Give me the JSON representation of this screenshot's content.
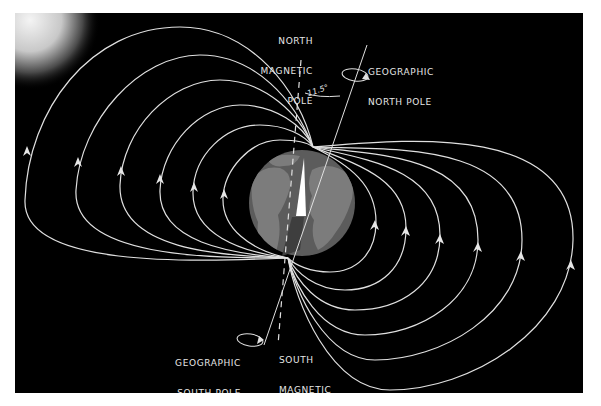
{
  "diagram": {
    "labels": {
      "north_magnetic_pole": [
        "NORTH",
        "MAGNETIC",
        "POLE"
      ],
      "geographic_north_pole": [
        "GEOGRAPHIC",
        "NORTH POLE"
      ],
      "geographic_south_pole": [
        "GEOGRAPHIC",
        "SOUTH POLE"
      ],
      "south_magnetic_pole": [
        "SOUTH",
        "MAGNETIC",
        "POLE"
      ],
      "tilt_angle": "11.5°"
    },
    "colors": {
      "background": "#000000",
      "field_lines": "#e0e0e0",
      "globe_ocean": "#5a5a5a",
      "globe_land": "#7a7a7a",
      "sun_glow": "#f0f0f0"
    },
    "poles": {
      "north_magnetic_convergence": [
        313,
        147
      ],
      "south_magnetic_convergence": [
        288,
        258
      ]
    },
    "field_line_count_per_side": 7,
    "arrows": {
      "left": [
        [
          27,
          152
        ],
        [
          78,
          163
        ],
        [
          121,
          172
        ],
        [
          160,
          180
        ],
        [
          194,
          188
        ],
        [
          224,
          195
        ]
      ],
      "right": [
        [
          374,
          226
        ],
        [
          405,
          232
        ],
        [
          439,
          240
        ],
        [
          477,
          248
        ],
        [
          520,
          257
        ],
        [
          570,
          266
        ]
      ]
    }
  }
}
